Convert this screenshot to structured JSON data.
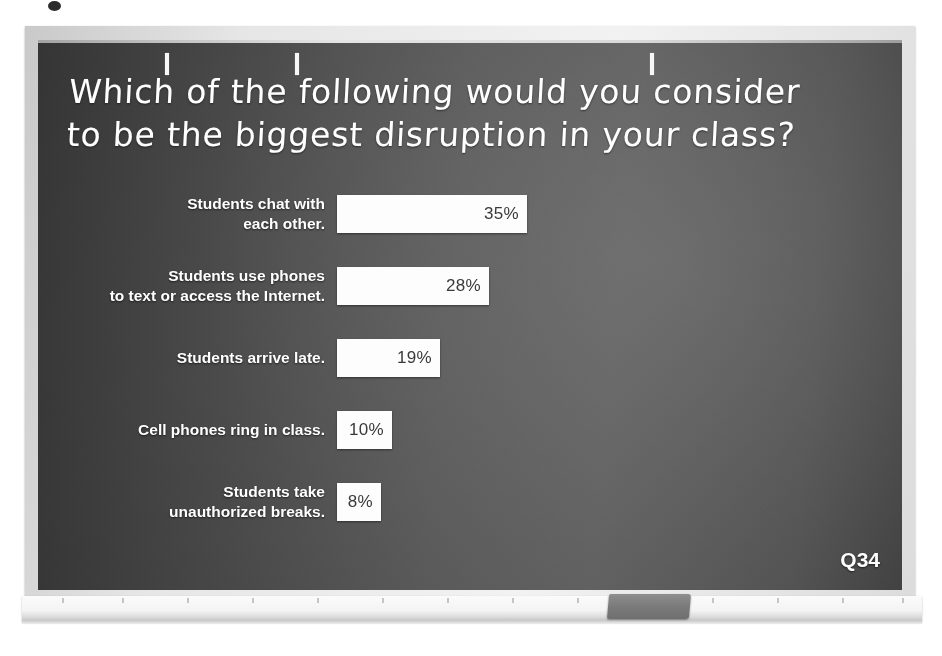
{
  "slide": {
    "title": "Which of the following would you consider\nto be the biggest disruption in your class?",
    "footer_code": "Q34"
  },
  "colors": {
    "screen_dark": "#4e4e4e",
    "bar_fill": "#fdfdfd",
    "bar_value_text": "#3a3a3a",
    "label_text": "#ffffff",
    "frame": "#e6e6e6"
  },
  "chart_data": {
    "type": "bar",
    "orientation": "horizontal",
    "title": "Which of the following would you consider to be the biggest disruption in your class?",
    "xlabel": "",
    "ylabel": "",
    "xlim": [
      0,
      35
    ],
    "grid": false,
    "legend": null,
    "categories": [
      "Students chat with\neach other.",
      "Students use phones\nto text or access the Internet.",
      "Students arrive late.",
      "Cell phones ring in class.",
      "Students take\nunauthorized breaks."
    ],
    "values": [
      35,
      28,
      19,
      10,
      8
    ],
    "value_labels": [
      "35%",
      "28%",
      "19%",
      "10%",
      "8%"
    ],
    "units": "percent"
  },
  "board": {
    "tick_positions": [
      165,
      295,
      650
    ],
    "tray_tick_positions": [
      40,
      100,
      165,
      230,
      295,
      360,
      425,
      490,
      555,
      620,
      690,
      755,
      820,
      880
    ],
    "eraser_name": "whiteboard-eraser"
  }
}
